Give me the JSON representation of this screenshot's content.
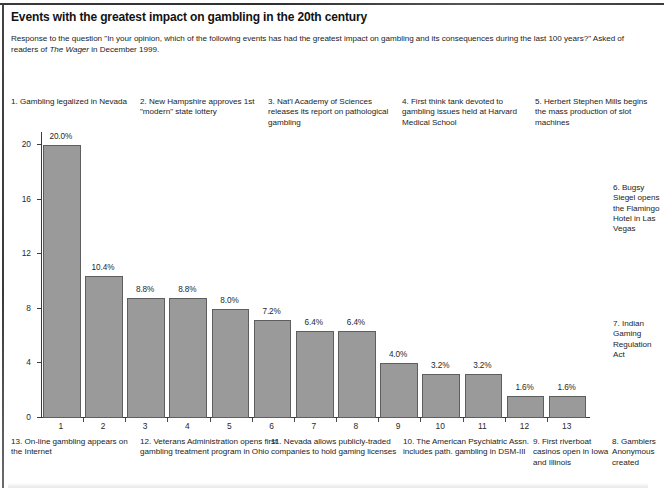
{
  "header": {
    "title": "Events with the greatest impact on gambling in the 20th century",
    "subtitle_part1": "Response to the question \"In your opinion, which of the following events has had the greatest impact on gambling and its consequences during the last 100 years?\" Asked of readers of ",
    "subtitle_italic": "The Wager",
    "subtitle_part2": " in December 1999."
  },
  "annotations": {
    "top": [
      {
        "id": "ann-1",
        "text": "1. Gambling legalized in Nevada"
      },
      {
        "id": "ann-2",
        "text": "2. New Hampshire approves 1st \"modern\" state lottery"
      },
      {
        "id": "ann-3",
        "text": "3. Nat'l Academy of Sciences releases its report on pathological gambling"
      },
      {
        "id": "ann-4",
        "text": "4. First think tank devoted to gambling issues held at Harvard Medical School"
      },
      {
        "id": "ann-5",
        "text": "5. Herbert Stephen Mills begins the mass production of slot machines"
      }
    ],
    "right": [
      {
        "id": "ann-6",
        "text": "6. Bugsy Siegel opens the Flamingo Hotel in Las Vegas"
      },
      {
        "id": "ann-7",
        "text": "7. Indian Gaming Regulation Act"
      }
    ],
    "bottom": [
      {
        "id": "ann-13",
        "text": "13. On-line gambling appears on the Internet"
      },
      {
        "id": "ann-12",
        "text": "12. Veterans Administration opens first gambling treatment program in Ohio"
      },
      {
        "id": "ann-11",
        "text": "11. Nevada allows publicly-traded companies to hold gaming licenses"
      },
      {
        "id": "ann-10",
        "text": "10. The American Psychiatric Assn. includes path. gambling in DSM-III"
      },
      {
        "id": "ann-9",
        "text": "9. First riverboat casinos open in Iowa and Illinois"
      },
      {
        "id": "ann-8",
        "text": "8. Gamblers Anonymous created"
      }
    ]
  },
  "chart_data": {
    "type": "bar",
    "title": "Events with the greatest impact on gambling in the 20th century",
    "xlabel": "",
    "ylabel": "",
    "ylim": [
      0,
      21.2
    ],
    "grid": false,
    "legend": "none",
    "bar_color": "#9a9a9a",
    "bar_border_color": "#5e5e5e",
    "categories": [
      "1",
      "2",
      "3",
      "4",
      "5",
      "6",
      "7",
      "8",
      "9",
      "10",
      "11",
      "12",
      "13"
    ],
    "values": [
      20.0,
      10.4,
      8.8,
      8.8,
      8.0,
      7.2,
      6.4,
      6.4,
      4.0,
      3.2,
      3.2,
      1.6,
      1.6
    ],
    "data_labels": [
      "20.0%",
      "10.4%",
      "8.8%",
      "8.8%",
      "8.0%",
      "7.2%",
      "6.4%",
      "6.4%",
      "4.0%",
      "3.2%",
      "3.2%",
      "1.6%",
      "1.6%"
    ],
    "yticks": [
      0,
      4,
      8,
      12,
      16,
      20
    ],
    "ytick_labels": [
      "0",
      "4",
      "8",
      "12",
      "16",
      "20"
    ]
  }
}
